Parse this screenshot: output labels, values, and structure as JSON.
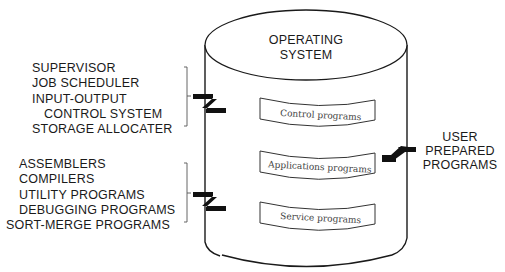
{
  "title": {
    "line1": "OPERATING",
    "line2": "SYSTEM"
  },
  "bands": [
    {
      "label": "Control programs"
    },
    {
      "label": "Applications programs"
    },
    {
      "label": "Service programs"
    }
  ],
  "control_group": {
    "items": [
      "SUPERVISOR",
      "JOB SCHEDULER",
      "INPUT-OUTPUT",
      "CONTROL SYSTEM",
      "STORAGE ALLOCATER"
    ]
  },
  "service_group": {
    "items": [
      "ASSEMBLERS",
      "COMPILERS",
      "UTILITY PROGRAMS",
      "DEBUGGING PROGRAMS",
      "SORT-MERGE PROGRAMS"
    ]
  },
  "user_group": {
    "line1": "USER",
    "line2": "PREPARED",
    "line3": "PROGRAMS"
  },
  "colors": {
    "ink": "#1a1a1a",
    "band_text": "#444444",
    "background": "#ffffff"
  }
}
